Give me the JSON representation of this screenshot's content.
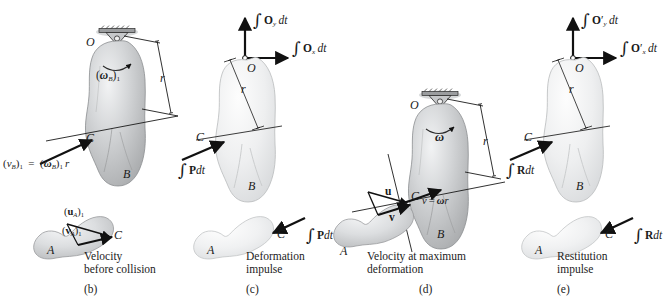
{
  "figure": {
    "background": "#ffffff",
    "body_fill_dark": "#b9bbbd",
    "body_fill_light": "#e9eaec",
    "stroke": "#1a1a1a"
  },
  "panels": [
    {
      "id": "b",
      "key": "panel_b",
      "tag": "(b)",
      "caption_line1": "Velocity",
      "caption_line2": "before collision",
      "body_letters": {
        "O": "O",
        "C": "C",
        "B": "B",
        "A": "A"
      },
      "dimension_label": "r",
      "labels": {
        "omega": "(ωB)1",
        "omega_base": "ω",
        "omega_sub": "B",
        "omega_post": "1",
        "velocity_eq": "(vB)1 = (ωB)1 r",
        "vec_u": "(uA)1",
        "vec_v": "(vA)1"
      }
    },
    {
      "id": "c",
      "key": "panel_c",
      "tag": "(c)",
      "caption_line1": "Deformation",
      "caption_line2": "impulse",
      "body_letters": {
        "O": "O",
        "C": "C",
        "B": "B",
        "A": "A"
      },
      "dimension_label": "r",
      "labels": {
        "impulse_Oy": "∫ Oy dt",
        "impulse_Ox": "∫ Ox dt",
        "impulse_P": "∫ P dt"
      }
    },
    {
      "id": "d",
      "key": "panel_d",
      "tag": "(d)",
      "caption_line1": "Velocity at maximum",
      "caption_line2": "deformation",
      "body_letters": {
        "O": "O",
        "C": "C",
        "B": "B",
        "A": "A"
      },
      "dimension_label": "r",
      "labels": {
        "omega": "ω",
        "vec_u": "u",
        "vec_v": "v",
        "velocity_eq": "v = ωr"
      }
    },
    {
      "id": "e",
      "key": "panel_e",
      "tag": "(e)",
      "caption_line1": "Restitution",
      "caption_line2": "impulse",
      "body_letters": {
        "O": "O",
        "C": "C",
        "B": "B",
        "A": "A"
      },
      "dimension_label": "r",
      "labels": {
        "impulse_Oy": "∫ O′y dt",
        "impulse_Ox": "∫ O′x dt",
        "impulse_R": "∫ R dt"
      }
    }
  ],
  "text": {
    "b_tag": "(b)",
    "c_tag": "(c)",
    "d_tag": "(d)",
    "e_tag": "(e)",
    "b_cap1": "Velocity",
    "b_cap2": "before collision",
    "c_cap1": "Deformation",
    "c_cap2": "impulse",
    "d_cap1": "Velocity at maximum",
    "d_cap2": "deformation",
    "e_cap1": "Restitution",
    "e_cap2": "impulse",
    "O": "O",
    "C": "C",
    "B": "B",
    "A": "A",
    "r": "r",
    "omega": "ω",
    "dt": "dt",
    "P": "P",
    "R": "R",
    "u": "u",
    "v": "v",
    "sub_B": "B",
    "sub_A": "A",
    "sub_x": "x",
    "sub_y": "y",
    "one": "1",
    "eq": "=",
    "prime": "′",
    "integral": "∫"
  }
}
